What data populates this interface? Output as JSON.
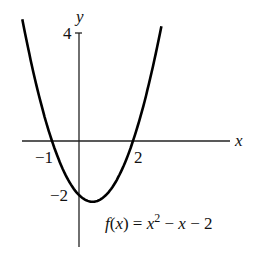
{
  "chart_data": {
    "type": "line",
    "title": "",
    "function": "f(x) = x^2 - x - 2",
    "annotation": {
      "f": "f",
      "x": "x",
      "eq_parts": [
        "f",
        "(",
        "x",
        ") = ",
        "x",
        "2",
        " − ",
        "x",
        " − 2"
      ]
    },
    "xlabel": "x",
    "ylabel": "y",
    "x_ticks": [
      {
        "value": -1,
        "label": "−1"
      },
      {
        "value": 2,
        "label": "2"
      }
    ],
    "y_ticks": [
      {
        "value": 4,
        "label": "4"
      },
      {
        "value": -2,
        "label": "−2"
      }
    ],
    "xlim": [
      -2.1,
      5.6
    ],
    "ylim": [
      -4.0,
      4.0
    ],
    "x": [
      -2.0,
      -1.5,
      -1.0,
      -0.5,
      0.0,
      0.5,
      1.0,
      1.5,
      2.0,
      2.5,
      3.0
    ],
    "y": [
      4.0,
      1.75,
      0.0,
      -1.25,
      -2.0,
      -2.25,
      -2.0,
      -1.25,
      0.0,
      1.75,
      4.0
    ],
    "grid": false,
    "legend": null
  }
}
